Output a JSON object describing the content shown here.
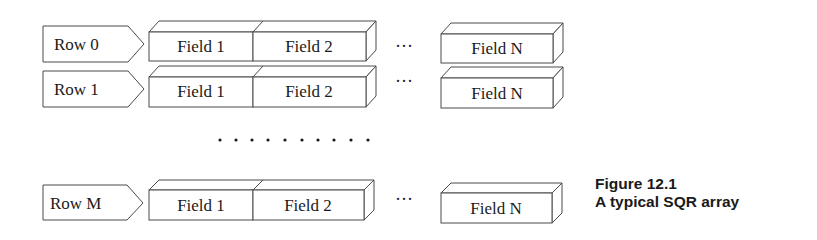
{
  "diagram": {
    "rows": [
      {
        "label": "Row 0",
        "fields": [
          "Field 1",
          "Field 2",
          "Field N"
        ],
        "ellipsis": "···"
      },
      {
        "label": "Row 1",
        "fields": [
          "Field 1",
          "Field 2",
          "Field N"
        ],
        "ellipsis": "···"
      },
      {
        "label": "Row M",
        "fields": [
          "Field 1",
          "Field 2",
          "Field N"
        ],
        "ellipsis": "···"
      }
    ],
    "vertical_ellipsis_dot_count": 10
  },
  "caption": {
    "figure_number": "Figure 12.1",
    "title": "A typical SQR array"
  },
  "colors": {
    "stroke": "#4a4a4a",
    "text": "#1a1a1a",
    "background": "#ffffff"
  }
}
